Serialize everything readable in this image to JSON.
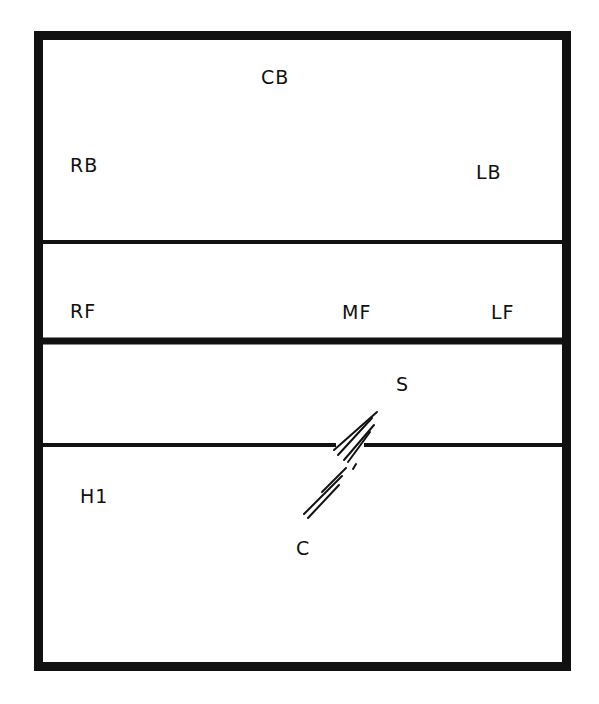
{
  "diagram": {
    "type": "field-layout",
    "colors": {
      "line": "#111111",
      "background": "#ffffff"
    },
    "zones": [
      {
        "id": "back-zone",
        "labels": [
          "CB",
          "RB",
          "LB"
        ]
      },
      {
        "id": "forward-zone",
        "labels": [
          "RF",
          "MF",
          "LF"
        ]
      },
      {
        "id": "upper-lower-zone",
        "labels": [
          "S"
        ]
      },
      {
        "id": "lower-zone",
        "labels": [
          "H1",
          "C"
        ]
      }
    ],
    "labels": {
      "cb": "CB",
      "rb": "RB",
      "lb": "LB",
      "rf": "RF",
      "mf": "MF",
      "lf": "LF",
      "s": "S",
      "h1": "H1",
      "c": "C"
    },
    "path": {
      "from": "S",
      "to": "C",
      "style": "hatched-diagonal"
    }
  }
}
